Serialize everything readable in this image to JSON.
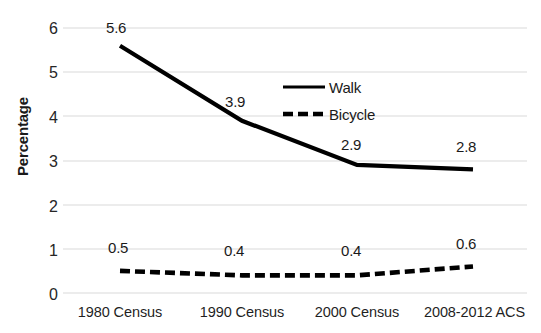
{
  "chart_data": {
    "type": "line",
    "title": "",
    "xlabel": "",
    "ylabel": "Percentage",
    "categories": [
      "1980 Census",
      "1990 Census",
      "2000 Census",
      "2008-2012 ACS"
    ],
    "series": [
      {
        "name": "Walk",
        "values": [
          5.6,
          3.9,
          2.9,
          2.8
        ],
        "style": "solid",
        "color": "#000000"
      },
      {
        "name": "Bicycle",
        "values": [
          0.5,
          0.4,
          0.4,
          0.6
        ],
        "style": "dashed",
        "color": "#000000"
      }
    ],
    "data_labels": {
      "Walk": [
        "5.6",
        "3.9",
        "2.9",
        "2.8"
      ],
      "Bicycle": [
        "0.5",
        "0.4",
        "0.4",
        "0.6"
      ]
    },
    "ylim": [
      0,
      6
    ],
    "yticks": [
      "0",
      "1",
      "2",
      "3",
      "4",
      "5",
      "6"
    ],
    "grid": "horizontal",
    "gridline_color": "#d9d9d9",
    "legend_position": "center-right-inside",
    "background": "#ffffff"
  },
  "axis": {
    "y_title": "Percentage"
  },
  "legend": {
    "items": [
      {
        "label": "Walk",
        "style": "solid"
      },
      {
        "label": "Bicycle",
        "style": "dashed"
      }
    ]
  }
}
